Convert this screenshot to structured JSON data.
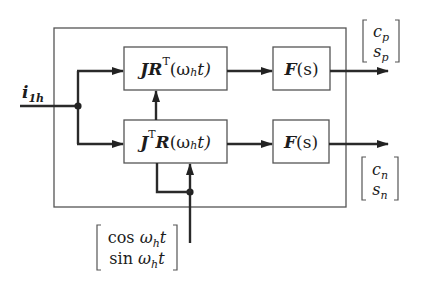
{
  "diagram": {
    "type": "block-diagram",
    "colors": {
      "line": "#2a2a2a",
      "box": "#555555",
      "text": "#1c1c1c",
      "background": "#ffffff"
    },
    "input": {
      "label_main": "i",
      "label_sub": "1h"
    },
    "blocks": {
      "top_transform": {
        "part1": "JR",
        "sup": "T",
        "arg": "(ω",
        "arg_sub": "h",
        "arg_end": "t)"
      },
      "bottom_transform": {
        "part1": "J",
        "sup": "T",
        "part2": "R",
        "arg": "(ω",
        "arg_sub": "h",
        "arg_end": "t)"
      },
      "filter_top": {
        "name": "F",
        "arg": "(s)"
      },
      "filter_bottom": {
        "name": "F",
        "arg": "(s)"
      }
    },
    "outputs": {
      "positive": {
        "row1": "c",
        "row1_sub": "p",
        "row2": "s",
        "row2_sub": "p"
      },
      "negative": {
        "row1": "c",
        "row1_sub": "n",
        "row2": "s",
        "row2_sub": "n"
      }
    },
    "reference": {
      "row1_fn": "cos ",
      "row1_var": "ω",
      "row1_sub": "h",
      "row1_end": "t",
      "row2_fn": "sin ",
      "row2_var": "ω",
      "row2_sub": "h",
      "row2_end": "t"
    }
  }
}
